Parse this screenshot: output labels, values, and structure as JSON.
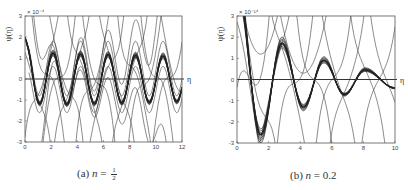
{
  "figures": [
    {
      "id": "a",
      "caption_prefix": "(a)",
      "caption_var": "n",
      "caption_eq": "=",
      "caption_value_num": "1",
      "caption_value_den": "2",
      "caption_value": "1/2",
      "ylabel": "ψ(η)",
      "xlabel": "η",
      "ymultiplier": "× 10⁻⁴"
    },
    {
      "id": "b",
      "caption_prefix": "(b)",
      "caption_var": "n",
      "caption_eq": "=",
      "caption_value": "0.2",
      "ylabel": "ψ(η)",
      "xlabel": "η",
      "ymultiplier": "× 10⁻¹⁴"
    }
  ],
  "chart_data": [
    {
      "type": "line",
      "title": "(a) n = 1/2",
      "xlabel": "η",
      "ylabel": "ψ(η)",
      "y_multiplier": "1e-4",
      "xlim": [
        0,
        12
      ],
      "ylim": [
        -3,
        3
      ],
      "xticks": [
        0,
        2,
        4,
        6,
        8,
        10,
        12
      ],
      "yticks": [
        -3,
        -2,
        -1,
        0,
        1,
        2,
        3
      ],
      "grid": false,
      "legend": null,
      "hline_at_zero": true,
      "main_bundle": {
        "description": "Thick bundle of near-sinusoidal trajectories",
        "start_value": 2.0,
        "amplitude": 1.25,
        "period": 2.1,
        "first_min_x": 1.1,
        "maxima_x": [
          2.2,
          4.3,
          6.4,
          8.5,
          10.6
        ],
        "minima_x": [
          1.1,
          3.2,
          5.3,
          7.4,
          9.5,
          11.6
        ],
        "extrema_values_approx": [
          -1.3,
          1.25,
          -1.25,
          1.2,
          -1.2,
          1.15,
          -1.15,
          1.1,
          -1.1,
          1.1
        ]
      },
      "transversal_curves": {
        "description": "Steep curves diverging to +/- bounds",
        "crossings_x_approx": [
          0.6,
          1.3,
          1.8,
          2.6,
          3.1,
          3.6,
          4.6,
          5.2,
          5.6,
          6.2,
          7.0,
          8.0,
          8.4,
          9.2,
          10.1,
          11.0,
          11.6
        ]
      }
    },
    {
      "type": "line",
      "title": "(b) n = 0.2",
      "xlabel": "η",
      "ylabel": "ψ(η)",
      "y_multiplier": "1e-14",
      "xlim": [
        0,
        10
      ],
      "ylim": [
        -3,
        3
      ],
      "xticks": [
        0,
        2,
        4,
        6,
        8,
        10
      ],
      "yticks": [
        -3,
        -2,
        -1,
        0,
        1,
        2,
        3
      ],
      "grid": false,
      "legend": null,
      "hline_at_zero": true,
      "main_bundle": {
        "description": "Thick bundle of damped oscillating trajectories",
        "start_value": 3.0,
        "extrema": [
          {
            "x": 1.5,
            "y": -2.6
          },
          {
            "x": 2.85,
            "y": 1.7
          },
          {
            "x": 4.2,
            "y": -1.3
          },
          {
            "x": 5.5,
            "y": 0.9
          },
          {
            "x": 6.8,
            "y": -0.7
          },
          {
            "x": 8.1,
            "y": 0.45
          },
          {
            "x": 10.0,
            "y": -0.4
          }
        ]
      },
      "transversal_curves": {
        "description": "Steep curves diverging to +/- bounds",
        "crossings_x_approx": [
          0.5,
          0.9,
          1.3,
          2.3,
          3.3,
          3.7,
          4.9,
          6.1,
          6.4,
          7.0,
          8.3,
          9.0,
          9.5
        ]
      }
    }
  ]
}
